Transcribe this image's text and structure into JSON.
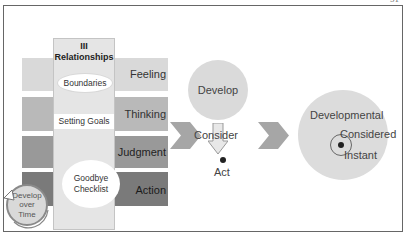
{
  "page": {
    "number_partial": "51"
  },
  "left_panel": {
    "column_title_line1": "III",
    "column_title_line2": "Relationships",
    "boundaries_label": "Boundaries",
    "setting_goals_label": "Setting Goals",
    "checklist_line1": "Goodbye",
    "checklist_line2": "Checklist",
    "cycle_line1": "Develop",
    "cycle_line2": "over",
    "cycle_line3": "Time",
    "bands": [
      {
        "label": "Feeling",
        "color": "#d9d9d9"
      },
      {
        "label": "Thinking",
        "color": "#b9b9b9"
      },
      {
        "label": "Judgment",
        "color": "#999999"
      },
      {
        "label": "Action",
        "color": "#7a7a7a"
      }
    ]
  },
  "middle_panel": {
    "develop_label": "Develop",
    "consider_label": "Consider",
    "act_label": "Act"
  },
  "right_panel": {
    "developmental_label": "Developmental",
    "considered_label": "Considered",
    "instant_label": "Instant"
  },
  "colors": {
    "chevron": "#a6a6a6",
    "frame": "#666666"
  }
}
